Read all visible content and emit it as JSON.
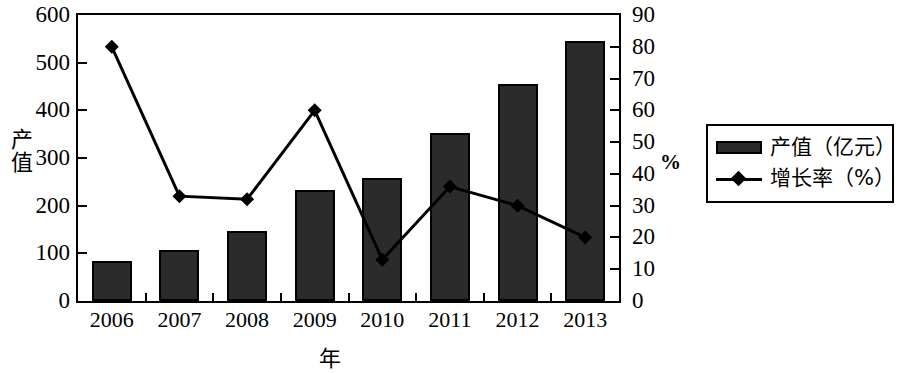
{
  "chart_data": {
    "type": "bar",
    "title": "",
    "xlabel": "年",
    "ylabel": "产值",
    "y2label": "%",
    "categories": [
      "2006",
      "2007",
      "2008",
      "2009",
      "2010",
      "2011",
      "2012",
      "2013"
    ],
    "ylim": [
      0,
      600
    ],
    "yticks": [
      0,
      100,
      200,
      300,
      400,
      500,
      600
    ],
    "y2lim": [
      0,
      90
    ],
    "y2ticks": [
      0,
      10,
      20,
      30,
      40,
      50,
      60,
      70,
      80,
      90
    ],
    "grid": false,
    "legend_position": "right",
    "series": [
      {
        "name": "产值（亿元）",
        "type": "bar",
        "axis": "left",
        "color": "#2b2b2b",
        "values": [
          83,
          106,
          146,
          232,
          258,
          352,
          455,
          546
        ]
      },
      {
        "name": "增长率（%）",
        "type": "line",
        "axis": "right",
        "color": "#000000",
        "marker": "diamond",
        "values": [
          80,
          33,
          32,
          60,
          13,
          36,
          30,
          20
        ]
      }
    ]
  },
  "axes": {
    "left_title": "产值",
    "bottom_title": "年",
    "right_title": "%",
    "left_ticks": [
      "600",
      "500",
      "400",
      "300",
      "200",
      "100",
      "0"
    ],
    "right_ticks": [
      "90",
      "80",
      "70",
      "60",
      "50",
      "40",
      "30",
      "20",
      "10",
      "0"
    ],
    "x_ticks": [
      "2006",
      "2007",
      "2008",
      "2009",
      "2010",
      "2011",
      "2012",
      "2013"
    ]
  },
  "legend": {
    "items": [
      {
        "label": "产值（亿元）",
        "marker": "bar-swatch"
      },
      {
        "label": "增长率（%）",
        "marker": "line-diamond-swatch"
      }
    ]
  }
}
